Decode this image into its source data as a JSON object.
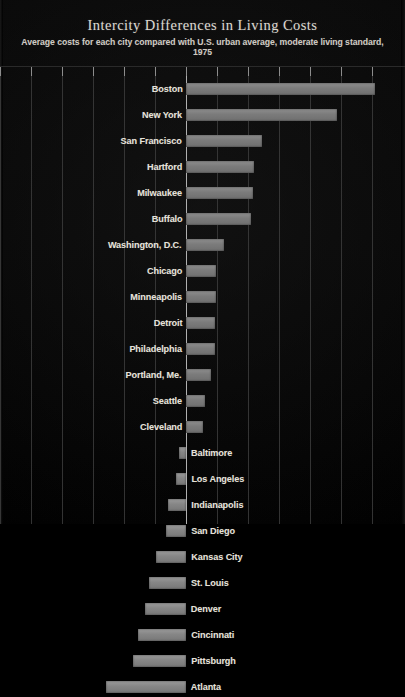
{
  "header": {
    "title": "Intercity Differences in Living Costs",
    "subtitle": "Average costs for each city compared with U.S. urban average, moderate living standard,  1975"
  },
  "axis": {
    "zero_x": 186,
    "tick_spacing": 31,
    "tick_count": 13,
    "first_tick_x": 0
  },
  "style": {
    "background": "#000000",
    "bar_color": "#808080",
    "grid_color": "#3c3c3c",
    "zero_line_color": "#b9b9b9",
    "text_color": "#e6e2da"
  },
  "chart_data": {
    "type": "bar",
    "orientation": "horizontal",
    "title": "Intercity Differences in Living Costs",
    "subtitle": "Average costs for each city compared with U.S. urban average, moderate living standard,  1975",
    "xlabel": "",
    "ylabel": "",
    "grid": true,
    "legend": "none",
    "unit": "percent difference from U.S. urban average",
    "xlim": [
      -30,
      30
    ],
    "categories": [
      "Boston",
      "New York",
      "San Francisco",
      "Hartford",
      "Milwaukee",
      "Buffalo",
      "Washington, D.C.",
      "Chicago",
      "Minneapolis",
      "Detroit",
      "Philadelphia",
      "Portland, Me.",
      "Seattle",
      "Cleveland",
      "Baltimore",
      "Los Angeles",
      "Indianapolis",
      "San Diego",
      "Kansas City",
      "St. Louis",
      "Denver",
      "Cincinnati",
      "Pittsburgh",
      "Atlanta"
    ],
    "values": [
      18.2,
      15.0,
      7.4,
      6.5,
      6.4,
      6.2,
      3.6,
      2.8,
      2.8,
      2.7,
      2.7,
      2.4,
      1.8,
      1.6,
      -0.7,
      -1.0,
      -1.7,
      -1.9,
      -2.9,
      -3.6,
      -4.0,
      -4.7,
      -5.2,
      -7.8
    ],
    "bars": [
      {
        "city": "Boston",
        "value": 18.2,
        "bar_start_px": 186,
        "bar_end_px": 375,
        "label_side": "left"
      },
      {
        "city": "New York",
        "value": 15.0,
        "bar_start_px": 186,
        "bar_end_px": 337,
        "label_side": "left"
      },
      {
        "city": "San Francisco",
        "value": 7.4,
        "bar_start_px": 186,
        "bar_end_px": 262,
        "label_side": "left"
      },
      {
        "city": "Hartford",
        "value": 6.5,
        "bar_start_px": 186,
        "bar_end_px": 254,
        "label_side": "left"
      },
      {
        "city": "Milwaukee",
        "value": 6.4,
        "bar_start_px": 186,
        "bar_end_px": 253,
        "label_side": "left"
      },
      {
        "city": "Buffalo",
        "value": 6.2,
        "bar_start_px": 186,
        "bar_end_px": 251,
        "label_side": "left"
      },
      {
        "city": "Washington, D.C.",
        "value": 3.6,
        "bar_start_px": 186,
        "bar_end_px": 224,
        "label_side": "left"
      },
      {
        "city": "Chicago",
        "value": 2.8,
        "bar_start_px": 186,
        "bar_end_px": 216,
        "label_side": "left"
      },
      {
        "city": "Minneapolis",
        "value": 2.8,
        "bar_start_px": 186,
        "bar_end_px": 216,
        "label_side": "left"
      },
      {
        "city": "Detroit",
        "value": 2.7,
        "bar_start_px": 186,
        "bar_end_px": 215,
        "label_side": "left"
      },
      {
        "city": "Philadelphia",
        "value": 2.7,
        "bar_start_px": 186,
        "bar_end_px": 215,
        "label_side": "left"
      },
      {
        "city": "Portland, Me.",
        "value": 2.4,
        "bar_start_px": 186,
        "bar_end_px": 211,
        "label_side": "left"
      },
      {
        "city": "Seattle",
        "value": 1.8,
        "bar_start_px": 186,
        "bar_end_px": 205,
        "label_side": "left"
      },
      {
        "city": "Cleveland",
        "value": 1.6,
        "bar_start_px": 186,
        "bar_end_px": 203,
        "label_side": "left"
      },
      {
        "city": "Baltimore",
        "value": -0.7,
        "bar_start_px": 179,
        "bar_end_px": 186,
        "label_side": "right"
      },
      {
        "city": "Los Angeles",
        "value": -1.0,
        "bar_start_px": 176,
        "bar_end_px": 186,
        "label_side": "right"
      },
      {
        "city": "Indianapolis",
        "value": -1.7,
        "bar_start_px": 168,
        "bar_end_px": 186,
        "label_side": "right"
      },
      {
        "city": "San Diego",
        "value": -1.9,
        "bar_start_px": 166,
        "bar_end_px": 186,
        "label_side": "right"
      },
      {
        "city": "Kansas City",
        "value": -2.9,
        "bar_start_px": 156,
        "bar_end_px": 186,
        "label_side": "right"
      },
      {
        "city": "St. Louis",
        "value": -3.6,
        "bar_start_px": 149,
        "bar_end_px": 186,
        "label_side": "right"
      },
      {
        "city": "Denver",
        "value": -4.0,
        "bar_start_px": 145,
        "bar_end_px": 186,
        "label_side": "right"
      },
      {
        "city": "Cincinnati",
        "value": -4.7,
        "bar_start_px": 138,
        "bar_end_px": 186,
        "label_side": "right"
      },
      {
        "city": "Pittsburgh",
        "value": -5.2,
        "bar_start_px": 133,
        "bar_end_px": 186,
        "label_side": "right"
      },
      {
        "city": "Atlanta",
        "value": -7.8,
        "bar_start_px": 106,
        "bar_end_px": 186,
        "label_side": "right"
      }
    ]
  }
}
